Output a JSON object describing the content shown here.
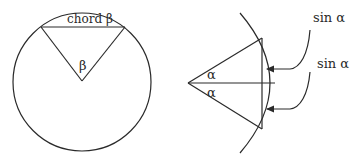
{
  "left_figure": {
    "chord_label": "chord β",
    "angle_label": "β"
  },
  "right_figure": {
    "angle_top_label": "α",
    "angle_bottom_label": "α",
    "sin_top_label": "sin α",
    "sin_bottom_label": "sin α"
  },
  "colors": {
    "line": "#2a2a2a",
    "background": "#ffffff"
  }
}
